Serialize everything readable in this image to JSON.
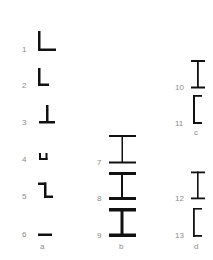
{
  "diagram": {
    "type": "steel-section-profiles",
    "columns": [
      {
        "label": "a",
        "profiles": [
          {
            "number": "1",
            "shape": "equal-angle"
          },
          {
            "number": "2",
            "shape": "unequal-angle"
          },
          {
            "number": "3",
            "shape": "tee"
          },
          {
            "number": "4",
            "shape": "u-channel-small"
          },
          {
            "number": "5",
            "shape": "z-section"
          },
          {
            "number": "6",
            "shape": "flat-bar"
          }
        ]
      },
      {
        "label": "b",
        "profiles": [
          {
            "number": "7",
            "shape": "i-beam-light"
          },
          {
            "number": "8",
            "shape": "i-beam-medium"
          },
          {
            "number": "9",
            "shape": "i-beam-heavy"
          }
        ]
      },
      {
        "label": "c",
        "profiles": [
          {
            "number": "10",
            "shape": "i-beam"
          },
          {
            "number": "11",
            "shape": "channel"
          }
        ]
      },
      {
        "label": "d",
        "profiles": [
          {
            "number": "12",
            "shape": "i-beam"
          },
          {
            "number": "13",
            "shape": "channel"
          }
        ]
      }
    ]
  },
  "colors": {
    "shape": "#111111",
    "label": "#8c8c8c",
    "background": "#ffffff"
  }
}
